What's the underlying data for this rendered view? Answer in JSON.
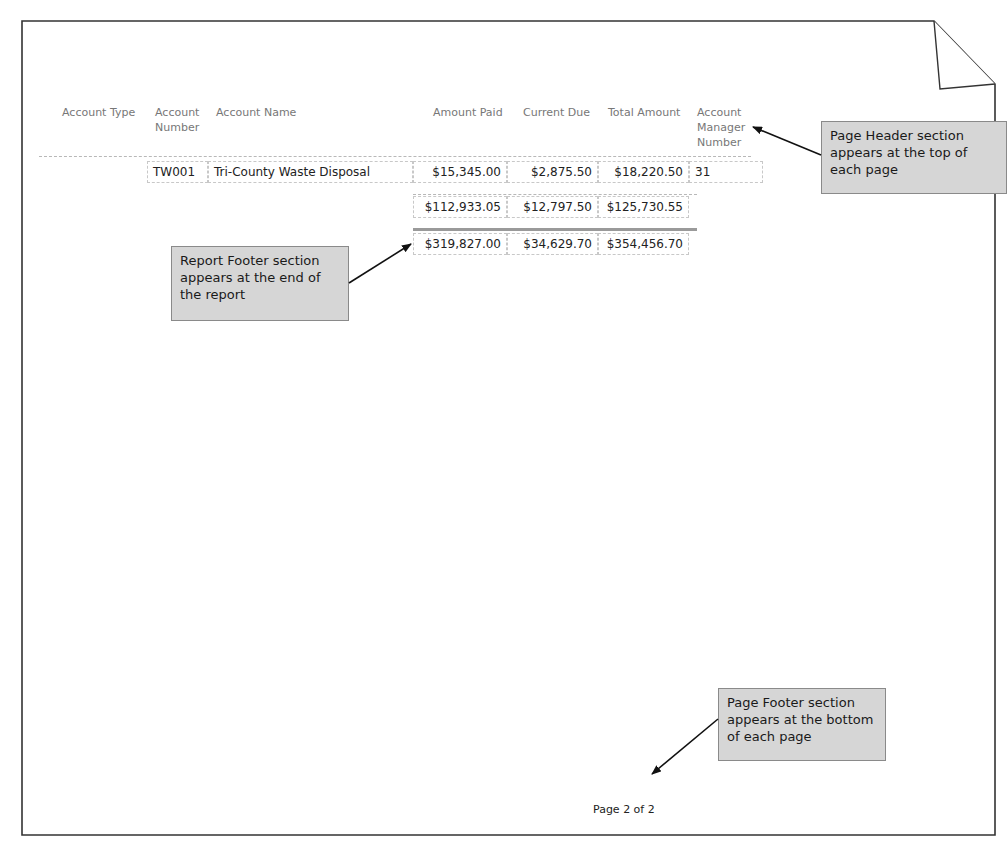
{
  "report": {
    "columns": [
      {
        "key": "account_type",
        "label": "Account Type"
      },
      {
        "key": "account_number",
        "label": "Account Number"
      },
      {
        "key": "account_name",
        "label": "Account Name"
      },
      {
        "key": "amount_paid",
        "label": "Amount Paid"
      },
      {
        "key": "current_due",
        "label": "Current Due"
      },
      {
        "key": "total_amount",
        "label": "Total Amount"
      },
      {
        "key": "account_manager_number",
        "label": "Account Manager Number"
      }
    ],
    "header_labels": {
      "account_type": "Account Type",
      "account_number_line1": "Account",
      "account_number_line2": "Number",
      "account_name": "Account Name",
      "amount_paid": "Amount Paid",
      "current_due": "Current Due",
      "total_amount": "Total Amount",
      "account_manager_line1": "Account",
      "account_manager_line2": "Manager",
      "account_manager_line3": "Number"
    },
    "rows": [
      {
        "account_type": "",
        "account_number": "TW001",
        "account_name": "Tri-County Waste Disposal",
        "amount_paid": "$15,345.00",
        "current_due": "$2,875.50",
        "total_amount": "$18,220.50",
        "account_manager_number": "31"
      }
    ],
    "group_totals": {
      "amount_paid": "$112,933.05",
      "current_due": "$12,797.50",
      "total_amount": "$125,730.55"
    },
    "report_totals": {
      "amount_paid": "$319,827.00",
      "current_due": "$34,629.70",
      "total_amount": "$354,456.70"
    },
    "page_footer": {
      "page_text": "Page 2 of 2"
    }
  },
  "callouts": {
    "page_header": "Page Header section appears at the top of each page",
    "report_footer": "Report Footer section appears at the end of the report",
    "page_footer": "Page Footer section appears at the bottom of each page"
  },
  "colors": {
    "callout_fill": "#d6d6d6",
    "callout_border": "#8a8a8a",
    "header_text": "#777777",
    "body_text": "#222222",
    "grand_total_rule": "#9a9a9a"
  }
}
